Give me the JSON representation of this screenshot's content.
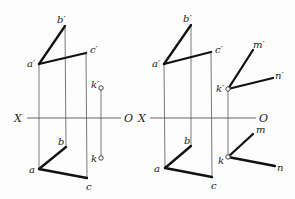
{
  "figures": [
    {
      "name": "left",
      "axis": {
        "x1": 27,
        "x2": 121,
        "y": 118,
        "label_x": "X",
        "label_x_pos": [
          14,
          122
        ],
        "label_o": "O",
        "label_o_pos": [
          124,
          122
        ]
      },
      "front": {
        "a": {
          "label": "a′",
          "x": 39,
          "y": 64,
          "lx": 27,
          "ly": 67
        },
        "b": {
          "label": "b′",
          "x": 65,
          "y": 26,
          "lx": 57,
          "ly": 23
        },
        "c": {
          "label": "c′",
          "x": 86,
          "y": 53,
          "lx": 90,
          "ly": 53
        },
        "k": {
          "label": "k′",
          "x": 101,
          "y": 88,
          "lx": 91,
          "ly": 88
        }
      },
      "top": {
        "a": {
          "label": "a",
          "x": 39,
          "y": 169,
          "lx": 29,
          "ly": 173
        },
        "b": {
          "label": "b",
          "x": 66,
          "y": 147,
          "lx": 58,
          "ly": 145
        },
        "c": {
          "label": "c",
          "x": 87,
          "y": 178,
          "lx": 86,
          "ly": 190
        },
        "k": {
          "label": "k",
          "x": 101,
          "y": 158,
          "lx": 91,
          "ly": 162
        }
      },
      "lines": [
        [
          "a",
          "b"
        ],
        [
          "a",
          "c"
        ]
      ],
      "k_marked": true
    },
    {
      "name": "right",
      "axis": {
        "x1": 150,
        "x2": 256,
        "y": 118,
        "label_x": "X",
        "label_x_pos": [
          138,
          122
        ],
        "label_o": "O",
        "label_o_pos": [
          259,
          122
        ]
      },
      "front": {
        "a": {
          "label": "a′",
          "x": 164,
          "y": 64,
          "lx": 152,
          "ly": 67
        },
        "b": {
          "label": "b′",
          "x": 191,
          "y": 25,
          "lx": 183,
          "ly": 22
        },
        "c": {
          "label": "c′",
          "x": 211,
          "y": 52,
          "lx": 215,
          "ly": 53
        },
        "k": {
          "label": "k′",
          "x": 228,
          "y": 89,
          "lx": 216,
          "ly": 92
        },
        "m": {
          "label": "m′",
          "x": 253,
          "y": 50,
          "lx": 253,
          "ly": 48
        },
        "n": {
          "label": "n′",
          "x": 273,
          "y": 78,
          "lx": 275,
          "ly": 79
        }
      },
      "top": {
        "a": {
          "label": "a",
          "x": 165,
          "y": 168,
          "lx": 154,
          "ly": 172
        },
        "b": {
          "label": "b",
          "x": 191,
          "y": 146,
          "lx": 184,
          "ly": 144
        },
        "c": {
          "label": "c",
          "x": 212,
          "y": 177,
          "lx": 211,
          "ly": 189
        },
        "k": {
          "label": "k",
          "x": 228,
          "y": 157,
          "lx": 218,
          "ly": 164
        },
        "m": {
          "label": "m",
          "x": 253,
          "y": 134,
          "lx": 256,
          "ly": 133
        },
        "n": {
          "label": "n",
          "x": 275,
          "y": 166,
          "lx": 277,
          "ly": 171
        }
      },
      "lines": [
        [
          "a",
          "b"
        ],
        [
          "a",
          "c"
        ],
        [
          "k",
          "m"
        ],
        [
          "k",
          "n"
        ]
      ],
      "k_marked": true
    }
  ]
}
